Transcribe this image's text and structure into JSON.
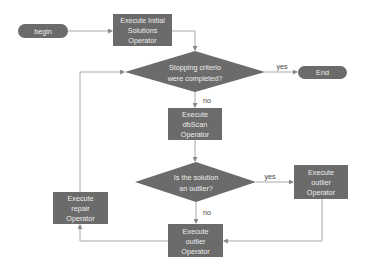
{
  "diagram": {
    "type": "flowchart",
    "colors": {
      "shape_fill": "#6b6b6b",
      "shape_text": "#eeeeee",
      "edge": "#a8a8a8",
      "label": "#444444",
      "background": "#ffffff"
    },
    "nodes": {
      "begin": {
        "shape": "terminal",
        "label": "begin"
      },
      "initial": {
        "shape": "process",
        "lines": [
          "Execute Initial",
          "Solutions",
          "Operator"
        ]
      },
      "stop_check": {
        "shape": "decision",
        "lines": [
          "Stopping criterio",
          "were completed?"
        ]
      },
      "end": {
        "shape": "terminal",
        "label": "End"
      },
      "dbscan": {
        "shape": "process",
        "lines": [
          "Execute",
          "dbScan",
          "Operator"
        ]
      },
      "outlier_check": {
        "shape": "decision",
        "lines": [
          "Is the solution",
          "an outlier?"
        ]
      },
      "outlier_right": {
        "shape": "process",
        "lines": [
          "Execute",
          "outlier",
          "Operator"
        ]
      },
      "outlier_bottom": {
        "shape": "process",
        "lines": [
          "Execute",
          "outlier",
          "Operator"
        ]
      },
      "repair": {
        "shape": "process",
        "lines": [
          "Execute",
          "repair",
          "Operator"
        ]
      }
    },
    "edges": {
      "stop_yes": {
        "from": "stop_check",
        "to": "end",
        "label": "yes"
      },
      "stop_no": {
        "from": "stop_check",
        "to": "dbscan",
        "label": "no"
      },
      "outlier_yes": {
        "from": "outlier_check",
        "to": "outlier_right",
        "label": "yes"
      },
      "outlier_no": {
        "from": "outlier_check",
        "to": "outlier_bottom",
        "label": "no"
      }
    }
  }
}
